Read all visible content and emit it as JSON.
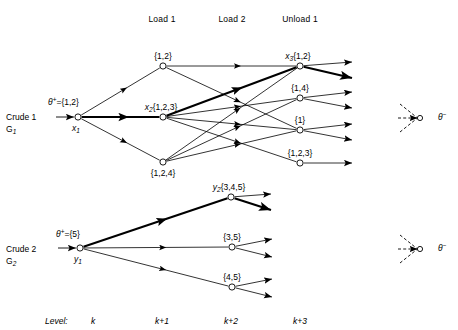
{
  "figure": {
    "title": "",
    "column_headers": [
      {
        "label": "Load 1",
        "x": 162,
        "y": 14
      },
      {
        "label": "Load 2",
        "x": 232,
        "y": 14
      },
      {
        "label": "Unload 1",
        "x": 300,
        "y": 14
      }
    ],
    "level_axis": {
      "prefix": "Level:",
      "prefix_x": 45,
      "prefix_y": 316,
      "ticks": [
        {
          "label": "k",
          "x": 93,
          "y": 316
        },
        {
          "label": "k+1",
          "x": 162,
          "y": 316
        },
        {
          "label": "k+2",
          "x": 231,
          "y": 316
        },
        {
          "label": "k+3",
          "x": 300,
          "y": 316
        }
      ]
    },
    "graphs": [
      {
        "name": "Crude 1",
        "row_label_line1": "Crude 1",
        "row_label_line2": "G",
        "row_label_sub": "1",
        "row_label_x": 6,
        "row_label_y": 112,
        "theta_plus": {
          "text": "θ",
          "sup": "+",
          "eq": "={1,2}",
          "x": 48,
          "y": 96
        },
        "root": {
          "id": "x1",
          "name": "x",
          "sub": "1",
          "x": 78,
          "y": 117,
          "label_pos": "below-left"
        },
        "nodes": [
          {
            "id": "n_12",
            "set": "{1,2}",
            "x": 163,
            "y": 66,
            "label_pos": "above"
          },
          {
            "id": "x2",
            "set": "{1,2,3}",
            "name": "x",
            "sub": "2",
            "x": 163,
            "y": 117,
            "label_pos": "above"
          },
          {
            "id": "n_124",
            "set": "{1,2,4}",
            "x": 163,
            "y": 162,
            "label_pos": "below"
          },
          {
            "id": "x3",
            "set": "{1,2}",
            "name": "x",
            "sub": "3",
            "x": 300,
            "y": 66,
            "label_pos": "above"
          },
          {
            "id": "n_14",
            "set": "{1,4}",
            "x": 300,
            "y": 98,
            "label_pos": "above"
          },
          {
            "id": "n_1",
            "set": "{1}",
            "x": 300,
            "y": 130,
            "label_pos": "above"
          },
          {
            "id": "n_123",
            "set": "{1,2,3}",
            "x": 300,
            "y": 163,
            "label_pos": "above"
          }
        ],
        "edges": [
          {
            "from": "x1",
            "to": "n_12",
            "bold": false
          },
          {
            "from": "x1",
            "to": "x2",
            "bold": true
          },
          {
            "from": "x1",
            "to": "n_124",
            "bold": false
          },
          {
            "from": "n_12",
            "to": "x3",
            "bold": false
          },
          {
            "from": "n_12",
            "to": "n_1",
            "bold": false
          },
          {
            "from": "x2",
            "to": "x3",
            "bold": true
          },
          {
            "from": "x2",
            "to": "n_14",
            "bold": false
          },
          {
            "from": "x2",
            "to": "n_1",
            "bold": false
          },
          {
            "from": "x2",
            "to": "n_123",
            "bold": false
          },
          {
            "from": "n_124",
            "to": "x3",
            "bold": false
          },
          {
            "from": "n_124",
            "to": "n_14",
            "bold": false
          },
          {
            "from": "n_124",
            "to": "n_1",
            "bold": false
          }
        ],
        "exits": [
          {
            "from": "x3",
            "dx": 52,
            "dy": -4,
            "bold": false
          },
          {
            "from": "x3",
            "dx": 52,
            "dy": 12,
            "bold": true
          },
          {
            "from": "n_14",
            "dx": 52,
            "dy": -6,
            "bold": false
          },
          {
            "from": "n_14",
            "dx": 52,
            "dy": 10,
            "bold": false
          },
          {
            "from": "n_1",
            "dx": 52,
            "dy": -6,
            "bold": false
          },
          {
            "from": "n_1",
            "dx": 52,
            "dy": 10,
            "bold": false
          },
          {
            "from": "n_123",
            "dx": 52,
            "dy": 0,
            "bold": false
          }
        ],
        "theta_minus": {
          "text": "θ",
          "sup": "−",
          "x": 438,
          "y": 117,
          "hub_x": 420,
          "hub_y": 118
        }
      },
      {
        "name": "Crude 2",
        "row_label_line1": "Crude 2",
        "row_label_line2": "G",
        "row_label_sub": "2",
        "row_label_x": 6,
        "row_label_y": 244,
        "theta_plus": {
          "text": "θ",
          "sup": "+",
          "eq": "={5}",
          "x": 56,
          "y": 228
        },
        "root": {
          "id": "y1",
          "name": "y",
          "sub": "1",
          "x": 80,
          "y": 248,
          "label_pos": "below-left"
        },
        "nodes": [
          {
            "id": "y2",
            "set": "{3,4,5}",
            "name": "y",
            "sub": "2",
            "x": 231,
            "y": 197,
            "label_pos": "above"
          },
          {
            "id": "n_35",
            "set": "{3,5}",
            "x": 232,
            "y": 247,
            "label_pos": "above"
          },
          {
            "id": "n_45",
            "set": "{4,5}",
            "x": 232,
            "y": 287,
            "label_pos": "above"
          }
        ],
        "edges": [
          {
            "from": "y1",
            "to": "y2",
            "bold": true
          },
          {
            "from": "y1",
            "to": "n_35",
            "bold": false
          },
          {
            "from": "y1",
            "to": "n_45",
            "bold": false
          }
        ],
        "exits": [
          {
            "from": "y2",
            "dx": 40,
            "dy": -3,
            "bold": false
          },
          {
            "from": "y2",
            "dx": 40,
            "dy": 13,
            "bold": true
          },
          {
            "from": "n_35",
            "dx": 40,
            "dy": -8,
            "bold": false
          },
          {
            "from": "n_35",
            "dx": 40,
            "dy": 10,
            "bold": false
          },
          {
            "from": "n_45",
            "dx": 40,
            "dy": -8,
            "bold": false
          },
          {
            "from": "n_45",
            "dx": 40,
            "dy": 10,
            "bold": false
          }
        ],
        "theta_minus": {
          "text": "θ",
          "sup": "−",
          "x": 438,
          "y": 248,
          "hub_x": 420,
          "hub_y": 249
        }
      }
    ]
  }
}
